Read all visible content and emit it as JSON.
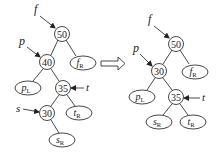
{
  "figure": {
    "transform_arrow": "double-arrow-right"
  },
  "left_tree": {
    "pointers": {
      "f": "f",
      "p": "p",
      "t": "t",
      "s": "s"
    },
    "nodes": {
      "n50": "50",
      "n40": "40",
      "n35": "35",
      "n30": "30"
    },
    "subtrees": {
      "fR": {
        "base": "f",
        "sub": "R"
      },
      "pL": {
        "base": "p",
        "sub": "L"
      },
      "tR": {
        "base": "t",
        "sub": "R"
      },
      "sR": {
        "base": "s",
        "sub": "R"
      }
    }
  },
  "right_tree": {
    "pointers": {
      "f": "f",
      "p": "p",
      "t": "t"
    },
    "nodes": {
      "n50": "50",
      "n30": "30",
      "n35": "35"
    },
    "subtrees": {
      "fR": {
        "base": "f",
        "sub": "R"
      },
      "pL": {
        "base": "p",
        "sub": "L"
      },
      "sR": {
        "base": "s",
        "sub": "R"
      },
      "tR": {
        "base": "t",
        "sub": "R"
      }
    }
  }
}
